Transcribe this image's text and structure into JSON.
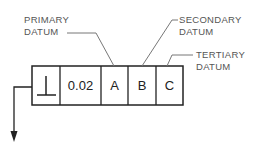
{
  "diagram": {
    "type": "feature-control-frame",
    "labels": {
      "primary": [
        "PRIMARY",
        "DATUM"
      ],
      "secondary": [
        "SECONDARY",
        "DATUM"
      ],
      "tertiary": [
        "TERTIARY",
        "DATUM"
      ]
    },
    "frame": {
      "cells": [
        {
          "name": "geometric-characteristic",
          "symbol": "⊥",
          "meaning": "perpendicularity"
        },
        {
          "name": "tolerance",
          "value": "0.02"
        },
        {
          "name": "primary-datum",
          "value": "A"
        },
        {
          "name": "secondary-datum",
          "value": "B"
        },
        {
          "name": "tertiary-datum",
          "value": "C"
        }
      ]
    },
    "colors": {
      "line": "#222222",
      "label": "#555555",
      "leader": "#777777"
    }
  }
}
